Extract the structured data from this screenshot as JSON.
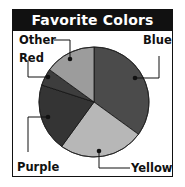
{
  "chart_data": {
    "type": "pie",
    "title": "Favorite Colors",
    "categories": [
      "Blue",
      "Yellow",
      "Purple",
      "Red",
      "Other"
    ],
    "values": [
      35,
      25,
      20,
      5,
      15
    ],
    "unit": "percent (estimated from slice angles)",
    "start_angle": "12 o'clock, clockwise",
    "slice_colors": {
      "Blue": "#4b4b4b",
      "Yellow": "#b7b7b7",
      "Purple": "#343434",
      "Red": "#3d3d3d",
      "Other": "#9c9c9c"
    },
    "legend": "none (callout labels with leader lines)",
    "labels": {
      "blue": "Blue",
      "yellow": "Yellow",
      "purple": "Purple",
      "red": "Red",
      "other": "Other"
    }
  },
  "colors": {
    "title_bg": "#111111",
    "title_text": "#ffffff",
    "border": "#111111"
  }
}
